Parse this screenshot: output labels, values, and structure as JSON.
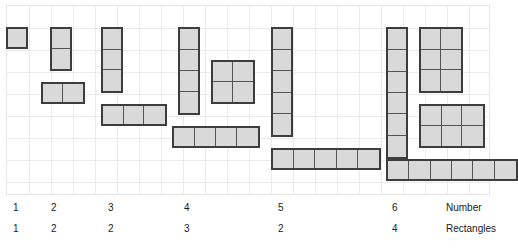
{
  "figure": {
    "type": "rectangle-array-grid",
    "grid": {
      "columns": 22,
      "rows": 9,
      "cell_px": 22,
      "origin_x": 6,
      "origin_y": 5,
      "line_color": "#eaeaea",
      "visible": true
    },
    "style": {
      "fill_color": "#d9d9d9",
      "border_color": "#3d3d3d",
      "divider_color": "#555555",
      "text_color": "#1a1a1a"
    }
  },
  "axis": {
    "number_caption": "Number",
    "rectangles_caption": "Rectangles"
  },
  "chart_data": {
    "type": "table",
    "title": "",
    "xlabel": "Number",
    "ylabel": "Rectangles",
    "categories": [
      "1",
      "2",
      "3",
      "4",
      "5",
      "6"
    ],
    "values": [
      1,
      2,
      2,
      3,
      2,
      4
    ],
    "series": [
      {
        "name": "Number",
        "values": [
          1,
          2,
          3,
          4,
          5,
          6
        ]
      },
      {
        "name": "Rectangles",
        "values": [
          1,
          2,
          2,
          3,
          2,
          4
        ]
      }
    ],
    "groups": [
      {
        "number": 1,
        "rectangle_count": 1,
        "label_x": 13,
        "shapes": [
          {
            "cols": 1,
            "rows": 1,
            "x": 6,
            "y": 27
          }
        ]
      },
      {
        "number": 2,
        "rectangle_count": 2,
        "label_x": 51,
        "shapes": [
          {
            "cols": 1,
            "rows": 2,
            "x": 50,
            "y": 27
          },
          {
            "cols": 2,
            "rows": 1,
            "x": 41,
            "y": 82
          }
        ]
      },
      {
        "number": 3,
        "rectangle_count": 2,
        "label_x": 108,
        "shapes": [
          {
            "cols": 1,
            "rows": 3,
            "x": 101,
            "y": 27
          },
          {
            "cols": 3,
            "rows": 1,
            "x": 101,
            "y": 104
          }
        ]
      },
      {
        "number": 4,
        "rectangle_count": 3,
        "label_x": 184,
        "shapes": [
          {
            "cols": 1,
            "rows": 4,
            "x": 178,
            "y": 27
          },
          {
            "cols": 2,
            "rows": 2,
            "x": 211,
            "y": 60
          },
          {
            "cols": 4,
            "rows": 1,
            "x": 172,
            "y": 126
          }
        ]
      },
      {
        "number": 5,
        "rectangle_count": 2,
        "label_x": 278,
        "shapes": [
          {
            "cols": 1,
            "rows": 5,
            "x": 271,
            "y": 27
          },
          {
            "cols": 5,
            "rows": 1,
            "x": 271,
            "y": 148
          }
        ]
      },
      {
        "number": 6,
        "rectangle_count": 4,
        "label_x": 392,
        "shapes": [
          {
            "cols": 1,
            "rows": 6,
            "x": 386,
            "y": 27
          },
          {
            "cols": 2,
            "rows": 3,
            "x": 419,
            "y": 27
          },
          {
            "cols": 3,
            "rows": 2,
            "x": 419,
            "y": 104
          },
          {
            "cols": 6,
            "rows": 1,
            "x": 386,
            "y": 159
          }
        ]
      }
    ],
    "caption_x": 446,
    "grid": true,
    "legend": "none"
  }
}
